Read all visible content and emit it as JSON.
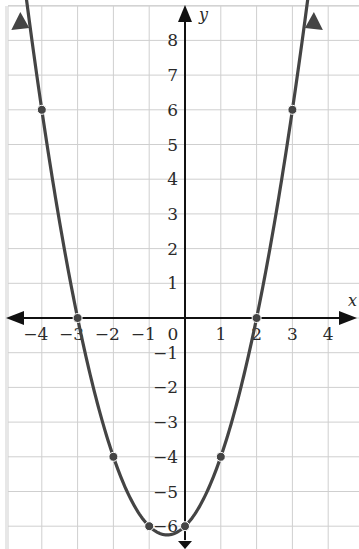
{
  "chart_data": {
    "type": "line",
    "title": "",
    "equation": "y = x^2 + x - 6",
    "xlabel": "x",
    "ylabel": "y",
    "xlim": [
      -5,
      5
    ],
    "ylim": [
      -6.5,
      8.5
    ],
    "grid": true,
    "x_ticks": [
      "-4",
      "-3",
      "-2",
      "-1",
      "0",
      "1",
      "2",
      "3",
      "4"
    ],
    "y_ticks": [
      "8",
      "7",
      "6",
      "5",
      "4",
      "3",
      "2",
      "1",
      "-1",
      "-2",
      "-3",
      "-4",
      "-5",
      "-6"
    ],
    "series": [
      {
        "name": "parabola",
        "points": [
          {
            "x": -4,
            "y": 6
          },
          {
            "x": -3,
            "y": 0
          },
          {
            "x": -2,
            "y": -4
          },
          {
            "x": -1,
            "y": -6
          },
          {
            "x": 0,
            "y": -6
          },
          {
            "x": 1,
            "y": -4
          },
          {
            "x": 2,
            "y": 0
          },
          {
            "x": 3,
            "y": 6
          }
        ]
      }
    ],
    "colors": {
      "curve": "#444444",
      "grid": "#cfcfcf",
      "axis": "#111111"
    }
  }
}
